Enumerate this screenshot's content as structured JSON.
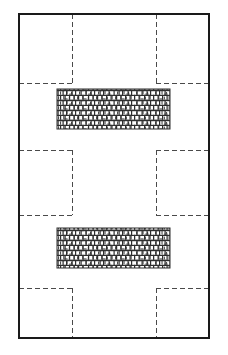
{
  "figure": {
    "type": "technical-line-drawing",
    "canvas": {
      "width": 228,
      "height": 355,
      "background": "#ffffff"
    },
    "styles": {
      "solid_stroke_color": "#1a1a1a",
      "solid_stroke_width": 1.6,
      "dashed_stroke_color": "#4a4a4a",
      "dashed_stroke_width": 1.0,
      "dash_pattern": "5 3",
      "hatch_fill_color": "#2e2e2e",
      "hatch_background": "#ffffff"
    },
    "outer_boundary": {
      "label": "outer-wall-outline",
      "x": 19,
      "y": 14,
      "width": 190,
      "height": 324
    },
    "hatched_blocks": [
      {
        "label": "masonry-block-upper",
        "x": 57,
        "y": 89,
        "width": 113,
        "height": 40,
        "pattern": "random-brick-hatch"
      },
      {
        "label": "masonry-block-lower",
        "x": 57,
        "y": 228,
        "width": 113,
        "height": 40,
        "pattern": "random-brick-hatch"
      }
    ],
    "dashed_guides": {
      "vertical_left_x": 72,
      "vertical_right_x": 156,
      "top_band_y": 83,
      "middle_band_top_y": 150,
      "middle_band_bottom_y": 215,
      "bottom_band_y": 288,
      "segments": [
        {
          "label": "top-left-vertical",
          "x1": 72,
          "y1": 14,
          "x2": 72,
          "y2": 83
        },
        {
          "label": "top-left-horizontal",
          "x1": 19,
          "y1": 83,
          "x2": 72,
          "y2": 83
        },
        {
          "label": "top-right-vertical",
          "x1": 156,
          "y1": 14,
          "x2": 156,
          "y2": 83
        },
        {
          "label": "top-right-horizontal",
          "x1": 156,
          "y1": 83,
          "x2": 209,
          "y2": 83
        },
        {
          "label": "mid-left-top-horizontal",
          "x1": 19,
          "y1": 150,
          "x2": 72,
          "y2": 150
        },
        {
          "label": "mid-left-vertical",
          "x1": 72,
          "y1": 150,
          "x2": 72,
          "y2": 215
        },
        {
          "label": "mid-left-bottom-horizontal",
          "x1": 19,
          "y1": 215,
          "x2": 72,
          "y2": 215
        },
        {
          "label": "mid-right-top-horizontal",
          "x1": 156,
          "y1": 150,
          "x2": 209,
          "y2": 150
        },
        {
          "label": "mid-right-vertical",
          "x1": 156,
          "y1": 150,
          "x2": 156,
          "y2": 215
        },
        {
          "label": "mid-right-bottom-horizontal",
          "x1": 156,
          "y1": 215,
          "x2": 209,
          "y2": 215
        },
        {
          "label": "bottom-left-horizontal",
          "x1": 19,
          "y1": 288,
          "x2": 72,
          "y2": 288
        },
        {
          "label": "bottom-left-vertical",
          "x1": 72,
          "y1": 288,
          "x2": 72,
          "y2": 338
        },
        {
          "label": "bottom-right-horizontal",
          "x1": 156,
          "y1": 288,
          "x2": 209,
          "y2": 288
        },
        {
          "label": "bottom-right-vertical",
          "x1": 156,
          "y1": 288,
          "x2": 156,
          "y2": 338
        }
      ]
    }
  }
}
